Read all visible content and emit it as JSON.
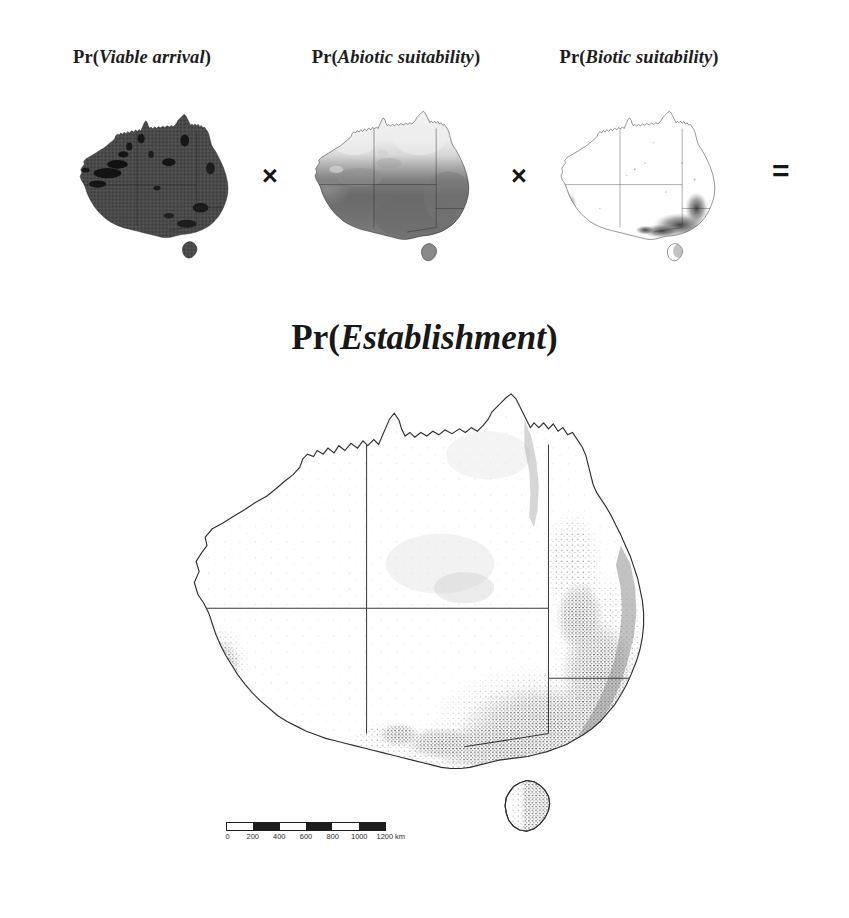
{
  "figure": {
    "title": "Pr(Establishment)",
    "title_prefix": "Pr(",
    "title_term": "Establishment",
    "title_suffix": ")",
    "background_color": "#ffffff",
    "ink_color": "#1d1d1d"
  },
  "panels": [
    {
      "id": "viable-arrival",
      "prefix": "Pr(",
      "term": "Viable arrival",
      "suffix": ")",
      "label": "Pr(Viable arrival)",
      "shading": "near-uniform dark grey over the whole continent with black patches inland",
      "fill_color": "#4a4a4a"
    },
    {
      "id": "abiotic-suitability",
      "prefix": "Pr(",
      "term": "Abiotic suitability",
      "suffix": ")",
      "label": "Pr(Abiotic suitability)",
      "shading": "light in the tropical north grading to dark grey across the southern half",
      "fill_color": "#6e6e6e"
    },
    {
      "id": "biotic-suitability",
      "prefix": "Pr(",
      "term": "Biotic suitability",
      "suffix": ")",
      "label": "Pr(Biotic suitability)",
      "shading": "almost entirely white with dark concentrations in the south-east and a small patch in south-west Western Australia",
      "fill_color": "#3c3c3c"
    }
  ],
  "operators": {
    "multiply": "×",
    "equals": "="
  },
  "result_map": {
    "id": "establishment",
    "label": "Pr(Establishment)",
    "shading": "white across the arid interior with dense grey speckle through Victoria, eastern New South Wales, south-east South Australia, eastern Tasmania and around Perth"
  },
  "scale_bar": {
    "units": "km",
    "tick_labels": [
      "0",
      "200",
      "400",
      "600",
      "800",
      "1000",
      "1200"
    ],
    "last_label": "1200 km",
    "segments": [
      "light",
      "dark",
      "light",
      "dark",
      "light",
      "dark"
    ],
    "segment_count": 6,
    "segment_km": 200,
    "total_km": 1200
  }
}
